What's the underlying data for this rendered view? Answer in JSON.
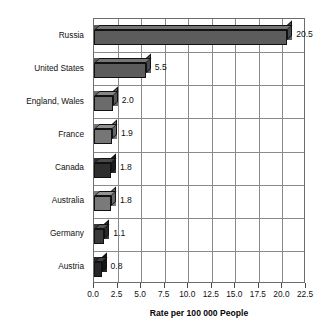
{
  "chart_data": {
    "type": "bar",
    "orientation": "horizontal",
    "title": "",
    "xlabel": "Rate per 100 000 People",
    "ylabel": "",
    "xlim": [
      0.0,
      22.5
    ],
    "xticks": [
      "0.0",
      "2.5",
      "5.0",
      "7.5",
      "10.0",
      "12.5",
      "15.0",
      "17.5",
      "20.0",
      "22.5"
    ],
    "xtick_values": [
      0.0,
      2.5,
      5.0,
      7.5,
      10.0,
      12.5,
      15.0,
      17.5,
      20.0,
      22.5
    ],
    "grid": "both",
    "legend": "none",
    "categories": [
      "Russia",
      "United States",
      "England, Wales",
      "France",
      "Canada",
      "Australia",
      "Germany",
      "Austria"
    ],
    "values": [
      20.5,
      5.5,
      2.0,
      1.9,
      1.8,
      1.8,
      1.1,
      0.8
    ],
    "value_labels": [
      "20.5",
      "5.5",
      "2.0",
      "1.9",
      "1.8",
      "1.8",
      "1.1",
      "0.8"
    ],
    "bar_colors": [
      "#5c5c5c",
      "#5c5c5c",
      "#6b6b6b",
      "#767676",
      "#2e2e2e",
      "#7a7a7a",
      "#3a3a3a",
      "#272727"
    ],
    "bars": [
      {
        "label": "Russia",
        "value": 20.5,
        "value_label": "20.5",
        "color": "#5c5c5c"
      },
      {
        "label": "United States",
        "value": 5.5,
        "value_label": "5.5",
        "color": "#5c5c5c"
      },
      {
        "label": "England, Wales",
        "value": 2.0,
        "value_label": "2.0",
        "color": "#6b6b6b"
      },
      {
        "label": "France",
        "value": 1.9,
        "value_label": "1.9",
        "color": "#767676"
      },
      {
        "label": "Canada",
        "value": 1.8,
        "value_label": "1.8",
        "color": "#2e2e2e"
      },
      {
        "label": "Australia",
        "value": 1.8,
        "value_label": "1.8",
        "color": "#7a7a7a"
      },
      {
        "label": "Germany",
        "value": 1.1,
        "value_label": "1.1",
        "color": "#3a3a3a"
      },
      {
        "label": "Austria",
        "value": 0.8,
        "value_label": "0.8",
        "color": "#272727"
      }
    ]
  },
  "style": {
    "background": "#ffffff",
    "frame_color": "#6d6d6d",
    "grid_color": "#8a8a8a",
    "text_color": "#111111"
  }
}
